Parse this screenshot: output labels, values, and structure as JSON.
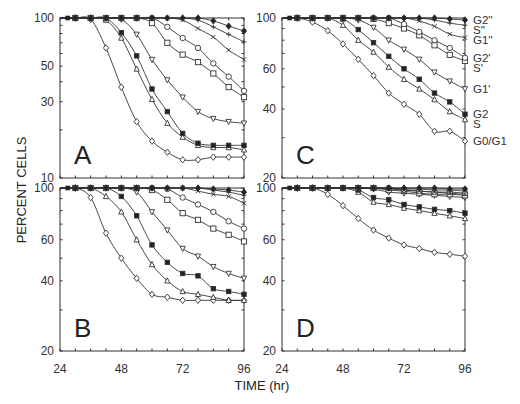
{
  "figure": {
    "ylabel": "PERCENT CELLS",
    "xlabel": "TIME (hr)"
  },
  "chart_data": [
    {
      "type": "line",
      "panel": "A",
      "title": "A",
      "xlabel": "TIME (hr)",
      "ylabel": "PERCENT CELLS",
      "yscale": "log",
      "ylim": [
        10,
        100
      ],
      "xlim": [
        24,
        96
      ],
      "yticks": [
        10,
        30,
        50,
        100
      ],
      "xticks": [
        24,
        48,
        72,
        96
      ],
      "show_xtick_labels": false,
      "x": [
        30,
        36,
        42,
        48,
        54,
        60,
        66,
        72,
        78,
        84,
        90,
        96
      ],
      "series": [
        {
          "name": "G0/G1",
          "marker": "diamond-open",
          "values": [
            100,
            98,
            65,
            37,
            22.5,
            17,
            14.5,
            13,
            13,
            13.5,
            13.5,
            13.5
          ]
        },
        {
          "name": "S",
          "marker": "triangle-open",
          "values": [
            100,
            100,
            97,
            75,
            48,
            31,
            22,
            18,
            16,
            15.5,
            15.5,
            15
          ]
        },
        {
          "name": "G2",
          "marker": "square-filled",
          "values": [
            100,
            100,
            100,
            81,
            58,
            36,
            26,
            19,
            16.5,
            16,
            16,
            16
          ]
        },
        {
          "name": "G1'",
          "marker": "triangle-down-open",
          "values": [
            100,
            100,
            100,
            98,
            79,
            55,
            41,
            32,
            26,
            23.5,
            22.5,
            22
          ]
        },
        {
          "name": "S'",
          "marker": "square-open",
          "values": [
            100,
            100,
            100,
            100,
            100,
            93,
            70,
            59,
            53,
            45,
            37,
            32
          ]
        },
        {
          "name": "G2'",
          "marker": "circle-open",
          "values": [
            100,
            100,
            100,
            100,
            100,
            100,
            88,
            75,
            65,
            52,
            43,
            35
          ]
        },
        {
          "name": "G1''",
          "marker": "x",
          "values": [
            100,
            100,
            100,
            100,
            100,
            100,
            100,
            97,
            86,
            76,
            63,
            55
          ]
        },
        {
          "name": "S''",
          "marker": "plus",
          "values": [
            100,
            100,
            100,
            100,
            100,
            100,
            100,
            100,
            97,
            88,
            79,
            71
          ]
        },
        {
          "name": "G2''",
          "marker": "diamond-filled",
          "values": [
            100,
            100,
            100,
            100,
            100,
            100,
            100,
            100,
            100,
            96,
            89,
            83
          ]
        }
      ]
    },
    {
      "type": "line",
      "panel": "C",
      "title": "C",
      "xlabel": "TIME (hr)",
      "ylabel": "PERCENT CELLS",
      "yscale": "log",
      "ylim": [
        20,
        100
      ],
      "xlim": [
        24,
        96
      ],
      "yticks": [
        20,
        40,
        60,
        100
      ],
      "xticks": [
        24,
        48,
        72,
        96
      ],
      "show_xtick_labels": false,
      "legend": [
        "G2''",
        "S''",
        "G1''",
        "G2'",
        "S'",
        "G1'",
        "G2",
        "S",
        "G0/G1"
      ],
      "legend_position": "right",
      "x": [
        30,
        36,
        42,
        48,
        54,
        60,
        66,
        72,
        78,
        84,
        90,
        96
      ],
      "series": [
        {
          "name": "G0/G1",
          "marker": "diamond-open",
          "values": [
            100,
            96,
            88,
            77,
            66,
            56,
            47,
            42,
            38,
            32,
            32,
            29
          ]
        },
        {
          "name": "S",
          "marker": "triangle-open",
          "values": [
            100,
            100,
            100,
            93,
            80,
            71,
            61,
            54,
            49,
            44,
            39,
            36
          ]
        },
        {
          "name": "G2",
          "marker": "square-filled",
          "values": [
            100,
            100,
            100,
            99,
            89,
            78,
            68,
            60,
            54,
            47,
            43,
            38
          ]
        },
        {
          "name": "G1'",
          "marker": "triangle-down-open",
          "values": [
            100,
            100,
            100,
            100,
            98,
            91,
            80,
            73,
            66,
            58,
            53,
            49
          ]
        },
        {
          "name": "S'",
          "marker": "square-open",
          "values": [
            100,
            100,
            100,
            100,
            100,
            99,
            95,
            90,
            84,
            76,
            69,
            65
          ]
        },
        {
          "name": "G2'",
          "marker": "circle-open",
          "values": [
            100,
            100,
            100,
            100,
            100,
            100,
            100,
            94,
            87,
            80,
            74,
            67
          ]
        },
        {
          "name": "G1''",
          "marker": "x",
          "values": [
            100,
            100,
            100,
            100,
            100,
            100,
            100,
            100,
            97,
            92,
            85,
            82
          ]
        },
        {
          "name": "S''",
          "marker": "plus",
          "values": [
            100,
            100,
            100,
            100,
            100,
            100,
            100,
            100,
            100,
            98,
            95,
            93
          ]
        },
        {
          "name": "G2''",
          "marker": "diamond-filled",
          "values": [
            100,
            100,
            100,
            100,
            100,
            100,
            100,
            100,
            100,
            100,
            99,
            98
          ]
        }
      ]
    },
    {
      "type": "line",
      "panel": "B",
      "title": "B",
      "xlabel": "TIME (hr)",
      "ylabel": "PERCENT CELLS",
      "yscale": "log",
      "ylim": [
        20,
        100
      ],
      "xlim": [
        24,
        96
      ],
      "yticks": [
        20,
        40,
        60,
        100
      ],
      "xticks": [
        24,
        48,
        72,
        96
      ],
      "show_xtick_labels": true,
      "x": [
        30,
        36,
        42,
        48,
        54,
        60,
        66,
        72,
        78,
        84,
        90,
        96
      ],
      "series": [
        {
          "name": "G0/G1",
          "marker": "diamond-open",
          "values": [
            100,
            91,
            64,
            50,
            41,
            35,
            34,
            33,
            33,
            33,
            33,
            33
          ]
        },
        {
          "name": "S",
          "marker": "triangle-open",
          "values": [
            100,
            100,
            92,
            79,
            60,
            47,
            40,
            36,
            35,
            34,
            33,
            33
          ]
        },
        {
          "name": "G2",
          "marker": "square-filled",
          "values": [
            100,
            100,
            100,
            92,
            76,
            57,
            48,
            43,
            42,
            37,
            36,
            35
          ]
        },
        {
          "name": "G1'",
          "marker": "triangle-down-open",
          "values": [
            100,
            100,
            100,
            100,
            96,
            79,
            66,
            55,
            51,
            46,
            43,
            41
          ]
        },
        {
          "name": "S'",
          "marker": "square-open",
          "values": [
            100,
            100,
            100,
            100,
            100,
            98,
            89,
            78,
            73,
            67,
            63,
            59
          ]
        },
        {
          "name": "G2'",
          "marker": "circle-open",
          "values": [
            100,
            100,
            100,
            100,
            100,
            100,
            99,
            91,
            85,
            79,
            72,
            67
          ]
        },
        {
          "name": "G1''",
          "marker": "x",
          "values": [
            100,
            100,
            100,
            100,
            100,
            100,
            100,
            100,
            97,
            94,
            92,
            86
          ]
        },
        {
          "name": "S''",
          "marker": "plus",
          "values": [
            100,
            100,
            100,
            100,
            100,
            100,
            100,
            100,
            100,
            98,
            96,
            93
          ]
        },
        {
          "name": "G2''",
          "marker": "diamond-filled",
          "values": [
            100,
            100,
            100,
            100,
            100,
            100,
            100,
            100,
            100,
            99,
            98,
            96
          ]
        }
      ]
    },
    {
      "type": "line",
      "panel": "D",
      "title": "D",
      "xlabel": "TIME (hr)",
      "ylabel": "PERCENT CELLS",
      "yscale": "log",
      "ylim": [
        20,
        100
      ],
      "xlim": [
        24,
        96
      ],
      "yticks": [
        20,
        40,
        60,
        100
      ],
      "xticks": [
        24,
        48,
        72,
        96
      ],
      "show_xtick_labels": true,
      "x": [
        30,
        36,
        42,
        48,
        54,
        60,
        66,
        72,
        78,
        84,
        90,
        96
      ],
      "series": [
        {
          "name": "G0/G1",
          "marker": "diamond-open",
          "values": [
            100,
            100,
            94,
            84,
            74,
            66,
            61,
            57,
            55,
            53,
            52,
            51
          ]
        },
        {
          "name": "S",
          "marker": "triangle-open",
          "values": [
            100,
            100,
            100,
            100,
            96,
            87,
            85,
            82,
            80,
            78,
            76,
            74
          ]
        },
        {
          "name": "G2",
          "marker": "square-filled",
          "values": [
            100,
            100,
            100,
            100,
            98,
            91,
            89,
            85,
            83,
            81,
            80,
            78
          ]
        },
        {
          "name": "G1'",
          "marker": "triangle-down-open",
          "values": [
            100,
            100,
            100,
            100,
            100,
            99,
            96,
            95,
            94,
            93,
            92,
            91
          ]
        },
        {
          "name": "S'",
          "marker": "square-open",
          "values": [
            100,
            100,
            100,
            100,
            100,
            100,
            98,
            97,
            95,
            94,
            94,
            93
          ]
        },
        {
          "name": "G2'",
          "marker": "circle-open",
          "values": [
            100,
            100,
            100,
            100,
            100,
            100,
            100,
            98,
            97,
            96,
            96,
            95
          ]
        },
        {
          "name": "G1''",
          "marker": "x",
          "values": [
            100,
            100,
            100,
            100,
            100,
            100,
            99,
            98,
            97,
            96,
            95,
            94
          ]
        },
        {
          "name": "S''",
          "marker": "plus",
          "values": [
            100,
            100,
            100,
            100,
            100,
            100,
            100,
            99,
            99,
            98,
            98,
            97
          ]
        },
        {
          "name": "G2''",
          "marker": "diamond-filled",
          "values": [
            100,
            100,
            100,
            100,
            100,
            100,
            100,
            100,
            100,
            100,
            99,
            99
          ]
        }
      ]
    }
  ],
  "layout": {
    "panels": {
      "A": {
        "left": 60,
        "right": 244,
        "top": 18,
        "bottom": 178
      },
      "C": {
        "left": 282,
        "right": 465,
        "top": 18,
        "bottom": 178
      },
      "B": {
        "left": 60,
        "right": 244,
        "top": 188,
        "bottom": 351
      },
      "D": {
        "left": 282,
        "right": 465,
        "top": 188,
        "bottom": 351
      }
    }
  }
}
